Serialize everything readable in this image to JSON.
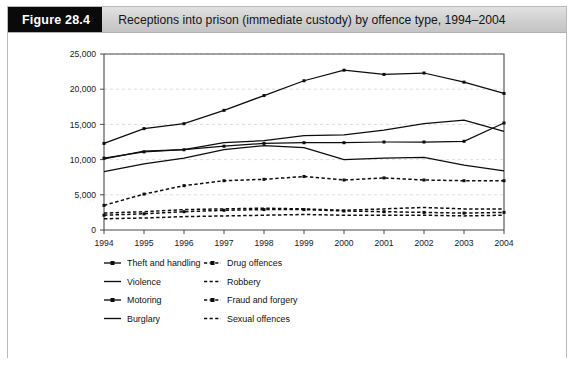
{
  "figure": {
    "tag": "Figure 28.4",
    "caption": "Receptions into prison (immediate custody) by offence type, 1994–2004"
  },
  "chart_data": {
    "type": "line",
    "title": "Receptions into prison (immediate custody) by offence type, 1994–2004",
    "xlabel": "",
    "ylabel": "",
    "x": [
      1994,
      1995,
      1996,
      1997,
      1998,
      1999,
      2000,
      2001,
      2002,
      2003,
      2004
    ],
    "categories": [
      "1994",
      "1995",
      "1996",
      "1997",
      "1998",
      "1999",
      "2000",
      "2001",
      "2002",
      "2003",
      "2004"
    ],
    "xtick_labels": [
      "1994",
      "1995",
      "1996",
      "1997",
      "1998",
      "1999",
      "2000",
      "2001",
      "2002",
      "2003",
      "2004"
    ],
    "ytick_labels": [
      "0",
      "5,000",
      "10,000",
      "15,000",
      "20,000",
      "25,000"
    ],
    "ytick_values": [
      0,
      5000,
      10000,
      15000,
      20000,
      25000
    ],
    "ylim": [
      0,
      25000
    ],
    "xlim": [
      1994,
      2004
    ],
    "grid": "horizontal-dashed",
    "legend_position": "below-plot-two-columns",
    "series": [
      {
        "name": "Theft and handling",
        "style": "solid-with-markers",
        "values": [
          12300,
          14400,
          15100,
          17000,
          19100,
          21200,
          22700,
          22100,
          22300,
          21000,
          19400
        ]
      },
      {
        "name": "Violence",
        "style": "solid",
        "values": [
          10100,
          11200,
          11400,
          12400,
          12700,
          13400,
          13500,
          14200,
          15100,
          15600,
          14000
        ]
      },
      {
        "name": "Motoring",
        "style": "solid-with-markers",
        "values": [
          10200,
          11100,
          11400,
          11900,
          12300,
          12400,
          12400,
          12500,
          12500,
          12600,
          15200
        ]
      },
      {
        "name": "Burglary",
        "style": "solid",
        "values": [
          8300,
          9400,
          10200,
          11400,
          12000,
          11700,
          10000,
          10200,
          10300,
          9200,
          8400
        ]
      },
      {
        "name": "Drug offences",
        "style": "dashed-with-markers",
        "values": [
          3500,
          5100,
          6300,
          7000,
          7200,
          7600,
          7100,
          7400,
          7100,
          7000,
          7000
        ]
      },
      {
        "name": "Robbery",
        "style": "dashed",
        "values": [
          2400,
          2600,
          2900,
          3000,
          3100,
          3000,
          2800,
          3000,
          3200,
          3000,
          3000
        ]
      },
      {
        "name": "Fraud and forgery",
        "style": "dashed-with-markers",
        "values": [
          2100,
          2300,
          2600,
          2800,
          2900,
          2900,
          2700,
          2600,
          2500,
          2400,
          2500
        ]
      },
      {
        "name": "Sexual offences",
        "style": "dashed",
        "values": [
          1600,
          1700,
          1900,
          2000,
          2100,
          2200,
          2100,
          2100,
          2100,
          2000,
          2100
        ]
      }
    ]
  },
  "legend": {
    "column_left": [
      "Theft and handling",
      "Violence",
      "Motoring",
      "Burglary"
    ],
    "column_right": [
      "Drug offences",
      "Robbery",
      "Fraud and forgery",
      "Sexual offences"
    ]
  },
  "colors": {
    "line": "#0d0d0d",
    "grid": "#d9d9d9",
    "axis": "#4a4a4a",
    "header_tag_bg": "#0a0a0a",
    "header_bg": "#cfcfcf",
    "card_border": "#b8b8b8"
  }
}
